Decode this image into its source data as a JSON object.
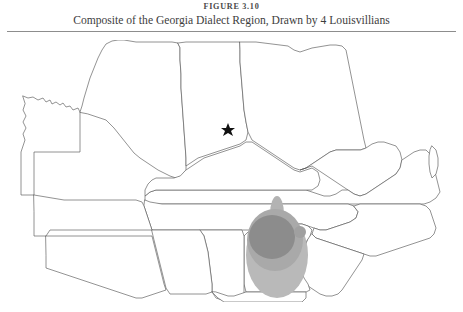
{
  "figure": {
    "label": "FIGURE 3.10",
    "caption": "Composite of the Georgia Dialect Region, Drawn by 4 Louisvillians",
    "rule_color": "#8d8d8d",
    "background_color": "#ffffff"
  },
  "map": {
    "outline_color": "#585858",
    "fill_color": "#ffffff",
    "states": [
      {
        "name": "Missouri",
        "abbr": "MO"
      },
      {
        "name": "Illinois",
        "abbr": "IL"
      },
      {
        "name": "Indiana",
        "abbr": "IN"
      },
      {
        "name": "Ohio",
        "abbr": "OH"
      },
      {
        "name": "Kentucky",
        "abbr": "KY"
      },
      {
        "name": "West Virginia",
        "abbr": "WV"
      },
      {
        "name": "Virginia",
        "abbr": "VA"
      },
      {
        "name": "Tennessee",
        "abbr": "TN"
      },
      {
        "name": "North Carolina",
        "abbr": "NC"
      },
      {
        "name": "South Carolina",
        "abbr": "SC"
      },
      {
        "name": "Georgia",
        "abbr": "GA"
      },
      {
        "name": "Alabama",
        "abbr": "AL"
      },
      {
        "name": "Mississippi",
        "abbr": "MS"
      },
      {
        "name": "Arkansas",
        "abbr": "AR"
      },
      {
        "name": "Louisiana",
        "abbr": "LA"
      },
      {
        "name": "Florida",
        "abbr": "FL"
      }
    ],
    "city_marker": {
      "name": "Louisville",
      "glyph": "star-marker",
      "color": "#111111",
      "x": 228,
      "y": 129
    },
    "dialect_region": {
      "label": "Georgia Dialect Region composite",
      "respondent_count": 4,
      "overlap_layers": [
        {
          "layer": "1 respondent",
          "color": "#b9b9b9"
        },
        {
          "layer": "2 respondents",
          "color": "#a9a9a9"
        },
        {
          "layer": "3-4 respondents",
          "color": "#8c8c8c"
        }
      ],
      "satellite_blob": {
        "color": "#a0a0a0",
        "x": 300,
        "y": 232
      },
      "northern_spur": {
        "color": "#b3b3b3",
        "x": 277,
        "y": 208
      }
    }
  }
}
